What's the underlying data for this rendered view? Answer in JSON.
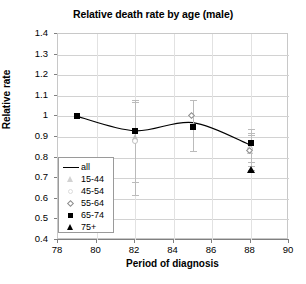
{
  "chart_data": {
    "type": "scatter",
    "title": "Relative death rate by age (male)",
    "xlabel": "Period of diagnosis",
    "ylabel": "Relative rate",
    "xlim": [
      78,
      90
    ],
    "ylim": [
      0.4,
      1.4
    ],
    "xticks": [
      78,
      80,
      82,
      84,
      86,
      88,
      90
    ],
    "yticks": [
      0.4,
      0.5,
      0.6,
      0.7,
      0.8,
      0.9,
      1.0,
      1.1,
      1.2,
      1.3,
      1.4
    ],
    "ytick_labels": [
      "0.4",
      "0.5",
      "0.6",
      "0.7",
      "0.8",
      "0.9",
      "1",
      "1.1",
      "1.2",
      "1.3",
      "1.4"
    ],
    "xtick_labels": [
      "78",
      "80",
      "82",
      "84",
      "86",
      "88",
      "90"
    ],
    "grid": "horizontal-and-vertical",
    "legend_position": "inside-lower-left",
    "x": [
      79,
      82,
      85,
      88
    ],
    "series": [
      {
        "name": "all",
        "marker": "line",
        "values": [
          1.0,
          0.93,
          0.97,
          0.86
        ]
      },
      {
        "name": "15-44",
        "marker": "triangle-open",
        "values": [
          null,
          0.9,
          null,
          0.83
        ],
        "err_low": [
          null,
          0.62,
          null,
          0.74
        ],
        "err_high": [
          null,
          1.07,
          null,
          0.92
        ]
      },
      {
        "name": "45-54",
        "marker": "circle-open",
        "values": [
          null,
          0.88,
          null,
          0.84
        ],
        "err_low": [
          null,
          0.68,
          null,
          0.78
        ],
        "err_high": [
          null,
          1.08,
          null,
          0.91
        ]
      },
      {
        "name": "55-64",
        "marker": "diamond-open",
        "values": [
          null,
          null,
          1.0,
          0.83
        ],
        "err_low": [
          null,
          null,
          0.83,
          0.76
        ],
        "err_high": [
          null,
          null,
          1.08,
          0.94
        ]
      },
      {
        "name": "65-74",
        "marker": "square-filled",
        "values": [
          1.0,
          0.93,
          0.95,
          0.87
        ]
      },
      {
        "name": "75+",
        "marker": "triangle-filled",
        "values": [
          null,
          null,
          null,
          0.74
        ]
      }
    ]
  },
  "legend": {
    "entries": [
      {
        "label": "all"
      },
      {
        "label": "15-44"
      },
      {
        "label": "45-54"
      },
      {
        "label": "55-64"
      },
      {
        "label": "65-74"
      },
      {
        "label": "75+"
      }
    ]
  }
}
